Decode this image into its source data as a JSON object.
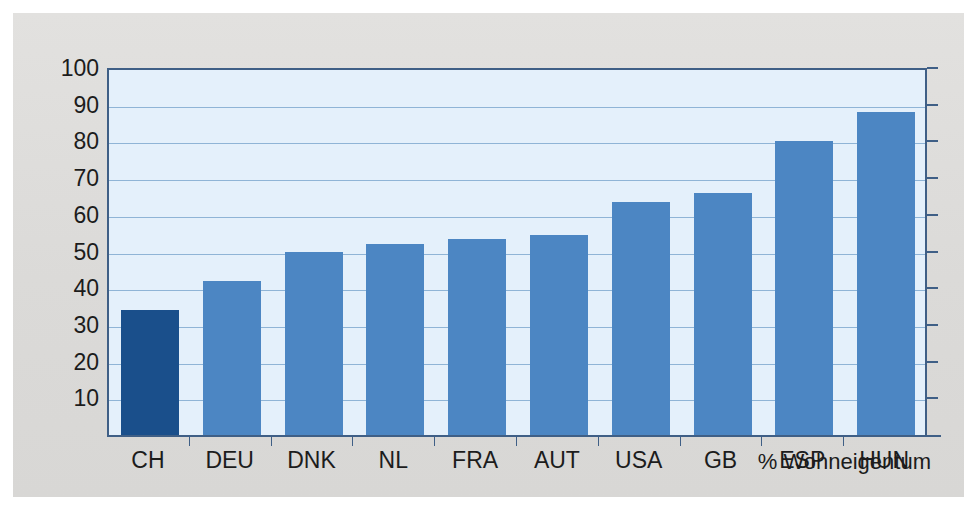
{
  "chart_data": {
    "type": "bar",
    "title": "",
    "subtitle": "",
    "xlabel": "",
    "ylabel": "",
    "caption": "% Wohneigentum",
    "categories": [
      "CH",
      "DEU",
      "DNK",
      "NL",
      "FRA",
      "AUT",
      "USA",
      "GB",
      "ESP",
      "HUN"
    ],
    "values": [
      34,
      42,
      50,
      52,
      53.5,
      54.5,
      63.5,
      66,
      80,
      88
    ],
    "highlight_category": "CH",
    "ylim": [
      0,
      100
    ],
    "ytick_labels": [
      "100",
      "90",
      "80",
      "70",
      "60",
      "50",
      "40",
      "30",
      "20",
      "10"
    ],
    "ytick_values": [
      100,
      90,
      80,
      70,
      60,
      50,
      40,
      30,
      20,
      10
    ],
    "grid": true,
    "legend": "none",
    "colors": {
      "bar": "#4c86c3",
      "bar_highlight": "#1a4f8b",
      "plot_background": "#e4f0fb",
      "gridline": "#8fb4d6",
      "axis": "#3f5f86",
      "panel_background": "#dddcda",
      "text": "#1c1c1c"
    }
  }
}
